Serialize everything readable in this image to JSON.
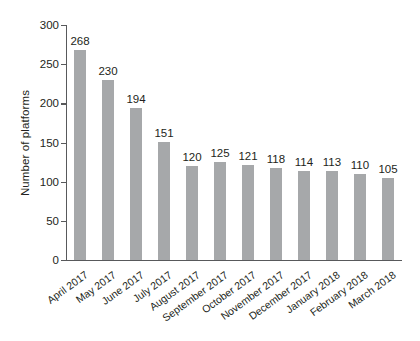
{
  "chart_data": {
    "type": "bar",
    "title": "",
    "xlabel": "",
    "ylabel": "Number of platforms",
    "ylim": [
      0,
      300
    ],
    "yticks": [
      0,
      50,
      100,
      150,
      200,
      250,
      300
    ],
    "grid": false,
    "legend": "none",
    "bar_color": "#a6a8aa",
    "text_color": "#231f20",
    "axis_color": "#58595b",
    "background": "#ffffff",
    "x_label_rotation_deg": -36,
    "show_value_labels": true,
    "categories": [
      "April 2017",
      "May 2017",
      "June 2017",
      "July 2017",
      "August 2017",
      "September 2017",
      "October 2017",
      "November 2017",
      "December 2017",
      "January 2018",
      "February 2018",
      "March 2018"
    ],
    "values": [
      268,
      230,
      194,
      151,
      120,
      125,
      121,
      118,
      114,
      113,
      110,
      105
    ],
    "value_labels": [
      "268",
      "230",
      "194",
      "151",
      "120",
      "125",
      "121",
      "118",
      "114",
      "113",
      "110",
      "105"
    ],
    "ytick_labels": [
      "0",
      "50",
      "100",
      "150",
      "200",
      "250",
      "300"
    ]
  }
}
